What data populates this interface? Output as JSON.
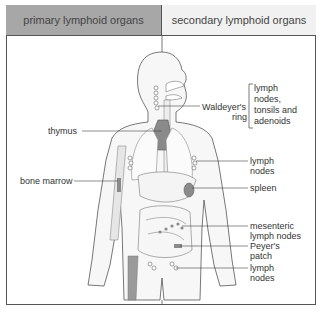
{
  "header": {
    "primary": "primary lymphoid organs",
    "secondary": "secondary lymphoid organs"
  },
  "labels": {
    "thymus": "thymus",
    "bone_marrow": "bone marrow",
    "waldeyer_line1": "Waldeyer's",
    "waldeyer_line2": "ring",
    "waldeyer_desc1": "lymph",
    "waldeyer_desc2": "nodes,",
    "waldeyer_desc3": "tonsils and",
    "waldeyer_desc4": "adenoids",
    "axillary_1": "lymph",
    "axillary_2": "nodes",
    "spleen": "spleen",
    "mesenteric_1": "mesenteric",
    "mesenteric_2": "lymph nodes",
    "peyers_1": "Peyer's",
    "peyers_2": "patch",
    "inguinal_1": "lymph",
    "inguinal_2": "nodes"
  },
  "colors": {
    "primary_header": "#a7a7a7",
    "secondary_header": "#f1f1f1",
    "organ_fill": "#8a8a8a",
    "outline": "#555555"
  }
}
